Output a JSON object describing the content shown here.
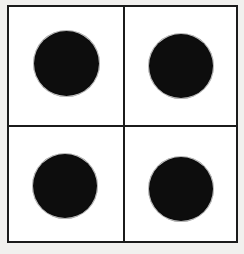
{
  "figure": {
    "background_color": "#f1f0ee",
    "cell_fill_color": "#ffffff",
    "line_color": "#1b1b1b",
    "dot_color": "#0d0d0d",
    "rows": 2,
    "columns": 2,
    "dot_count": 4
  },
  "grid": {
    "frame": {
      "label": "grid-frame",
      "x": 7,
      "y": 5,
      "width": 231,
      "height": 238,
      "border_width": 2
    },
    "dividers": [
      {
        "label": "divider-vertical",
        "orientation": "vertical",
        "position": 123,
        "thickness": 2
      },
      {
        "label": "divider-horizontal",
        "orientation": "horizontal",
        "position": 125,
        "thickness": 2
      }
    ],
    "cells": [
      {
        "label": "top-left",
        "row": 1,
        "column": 1,
        "dot": true
      },
      {
        "label": "top-right",
        "row": 1,
        "column": 2,
        "dot": true
      },
      {
        "label": "bottom-left",
        "row": 2,
        "column": 1,
        "dot": true
      },
      {
        "label": "bottom-right",
        "row": 2,
        "column": 2,
        "dot": true
      }
    ]
  },
  "dots": [
    {
      "label": "top-left",
      "center_x": 66,
      "center_y": 63,
      "diameter": 65
    },
    {
      "label": "top-right",
      "center_x": 181,
      "center_y": 66,
      "diameter": 64
    },
    {
      "label": "bottom-left",
      "center_x": 65,
      "center_y": 186,
      "diameter": 64
    },
    {
      "label": "bottom-right",
      "center_x": 181,
      "center_y": 189,
      "diameter": 64
    }
  ]
}
